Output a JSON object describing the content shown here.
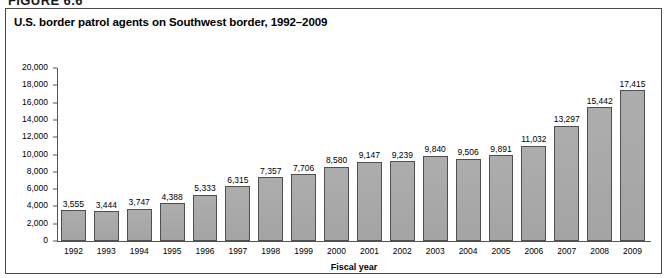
{
  "figure": {
    "number_label": "FIGURE 6.6",
    "title": "U.S. border patrol agents on Southwest border, 1992–2009"
  },
  "chart_data": {
    "type": "bar",
    "title": "U.S. border patrol agents on Southwest border, 1992–2009",
    "xlabel": "Fiscal year",
    "ylabel": "",
    "ylim": [
      0,
      20000
    ],
    "ytick_step": 2000,
    "ytick_labels": [
      "20,000",
      "18,000",
      "16,000",
      "14,000",
      "12,000",
      "10,000",
      "8,000",
      "6,000",
      "4,000",
      "2,000",
      "0"
    ],
    "ytick_values": [
      20000,
      18000,
      16000,
      14000,
      12000,
      10000,
      8000,
      6000,
      4000,
      2000,
      0
    ],
    "grid": false,
    "legend": false,
    "bar_color": "#a9a9a9",
    "bar_edge_color": "#4f4f4f",
    "categories": [
      "1992",
      "1993",
      "1994",
      "1995",
      "1996",
      "1997",
      "1998",
      "1999",
      "2000",
      "2001",
      "2002",
      "2003",
      "2004",
      "2005",
      "2006",
      "2007",
      "2008",
      "2009"
    ],
    "values": [
      3555,
      3444,
      3747,
      4388,
      5333,
      6315,
      7357,
      7706,
      8580,
      9147,
      9239,
      9840,
      9506,
      9891,
      11032,
      13297,
      15442,
      17415
    ],
    "value_labels": [
      "3,555",
      "3,444",
      "3,747",
      "4,388",
      "5,333",
      "6,315",
      "7,357",
      "7,706",
      "8,580",
      "9,147",
      "9,239",
      "9,840",
      "9,506",
      "9,891",
      "11,032",
      "13,297",
      "15,442",
      "17,415"
    ]
  }
}
